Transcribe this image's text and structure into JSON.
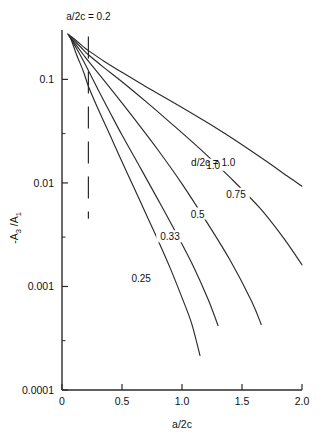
{
  "chart_data": {
    "type": "line",
    "title": "",
    "xlabel": "a/2c",
    "ylabel": "-A3 / A1",
    "ylabel_parts": {
      "minus": "-",
      "a": "A",
      "sub_num": "3",
      "slash": " /",
      "a2": "A",
      "sub_den": "1"
    },
    "xlim": [
      0,
      2.0
    ],
    "ylim": [
      0.0001,
      0.3
    ],
    "yscale": "log",
    "xscale": "linear",
    "grid": false,
    "legend": "inline curve labels",
    "xticks": [
      "0",
      "0.5",
      "1.0",
      "1.5",
      "2.0"
    ],
    "xtick_values": [
      0,
      0.5,
      1.0,
      1.5,
      2.0
    ],
    "yticks": [
      "0.1",
      "0.01",
      "0.001",
      "0.0001"
    ],
    "ytick_values": [
      0.1,
      0.01,
      0.001,
      0.0001
    ],
    "annotations": [
      {
        "text": "a/2c = 0.2",
        "x": 0.22,
        "y": 0.3,
        "name": "a-over-2c-annotation"
      },
      {
        "text": "d/2c = 1.0",
        "x": 1.26,
        "y": 0.0145,
        "name": "d-over-2c-annotation"
      }
    ],
    "reference_line": {
      "type": "vertical-dashed",
      "x": 0.22,
      "y_from": 0.0045,
      "y_to": 0.26
    },
    "series": [
      {
        "name": "0.25",
        "label": "0.25",
        "label_x": 0.66,
        "label_y": 0.00118,
        "points": [
          [
            0.07,
            0.255
          ],
          [
            0.12,
            0.175
          ],
          [
            0.18,
            0.118
          ],
          [
            0.22,
            0.086
          ],
          [
            0.3,
            0.052
          ],
          [
            0.4,
            0.029
          ],
          [
            0.5,
            0.016
          ],
          [
            0.6,
            0.009
          ],
          [
            0.7,
            0.005
          ],
          [
            0.8,
            0.0028
          ],
          [
            0.9,
            0.00152
          ],
          [
            1.0,
            0.00078
          ],
          [
            1.08,
            0.00044
          ],
          [
            1.15,
            0.000215
          ]
        ]
      },
      {
        "name": "0.33",
        "label": "0.33",
        "label_x": 0.9,
        "label_y": 0.00295,
        "points": [
          [
            0.06,
            0.262
          ],
          [
            0.12,
            0.2
          ],
          [
            0.18,
            0.15
          ],
          [
            0.22,
            0.122
          ],
          [
            0.3,
            0.08
          ],
          [
            0.4,
            0.048
          ],
          [
            0.5,
            0.029
          ],
          [
            0.65,
            0.0142
          ],
          [
            0.8,
            0.0069
          ],
          [
            0.95,
            0.0033
          ],
          [
            1.1,
            0.00152
          ],
          [
            1.22,
            0.00074
          ],
          [
            1.3,
            0.00042
          ]
        ]
      },
      {
        "name": "0.5",
        "label": "0.5",
        "label_x": 1.13,
        "label_y": 0.0049,
        "points": [
          [
            0.055,
            0.268
          ],
          [
            0.12,
            0.213
          ],
          [
            0.18,
            0.172
          ],
          [
            0.22,
            0.15
          ],
          [
            0.32,
            0.108
          ],
          [
            0.45,
            0.07
          ],
          [
            0.6,
            0.042
          ],
          [
            0.8,
            0.0208
          ],
          [
            1.0,
            0.0098
          ],
          [
            1.2,
            0.0043
          ],
          [
            1.4,
            0.0018
          ],
          [
            1.58,
            0.00072
          ],
          [
            1.66,
            0.00043
          ]
        ]
      },
      {
        "name": "0.75",
        "label": "0.75",
        "label_x": 1.45,
        "label_y": 0.0076,
        "points": [
          [
            0.05,
            0.272
          ],
          [
            0.12,
            0.226
          ],
          [
            0.18,
            0.192
          ],
          [
            0.22,
            0.173
          ],
          [
            0.35,
            0.13
          ],
          [
            0.5,
            0.095
          ],
          [
            0.7,
            0.061
          ],
          [
            0.9,
            0.0385
          ],
          [
            1.15,
            0.0213
          ],
          [
            1.4,
            0.0113
          ],
          [
            1.65,
            0.0057
          ],
          [
            1.85,
            0.0029
          ],
          [
            2.0,
            0.00162
          ]
        ]
      },
      {
        "name": "1.0",
        "label": "1.0",
        "label_x": 1.26,
        "label_y": 0.0145,
        "points": [
          [
            0.048,
            0.275
          ],
          [
            0.12,
            0.236
          ],
          [
            0.18,
            0.206
          ],
          [
            0.22,
            0.19
          ],
          [
            0.35,
            0.15
          ],
          [
            0.5,
            0.117
          ],
          [
            0.7,
            0.085
          ],
          [
            0.95,
            0.058
          ],
          [
            1.2,
            0.039
          ],
          [
            1.45,
            0.0256
          ],
          [
            1.7,
            0.0163
          ],
          [
            1.88,
            0.0116
          ],
          [
            2.0,
            0.0093
          ]
        ]
      }
    ]
  }
}
